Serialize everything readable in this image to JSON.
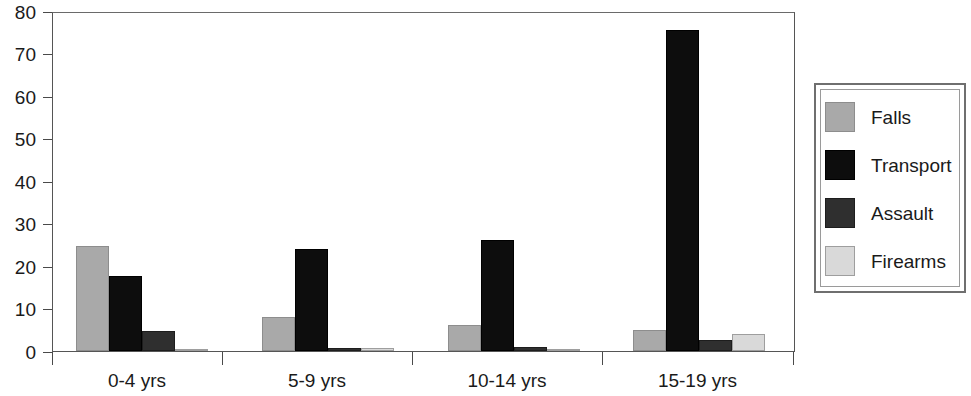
{
  "chart_data": {
    "type": "bar",
    "title": "",
    "subtitle": "",
    "xlabel": "",
    "ylabel": "",
    "categories": [
      "0-4 yrs",
      "5-9 yrs",
      "10-14 yrs",
      "15-19 yrs"
    ],
    "series": [
      {
        "name": "Falls",
        "color": "#a9a9a9",
        "values": [
          24.8,
          8.0,
          6.1,
          5.0
        ]
      },
      {
        "name": "Transport",
        "color": "#0d0d0d",
        "values": [
          17.6,
          24.0,
          26.2,
          75.5
        ]
      },
      {
        "name": "Assault",
        "color": "#2f2f2f",
        "values": [
          4.7,
          0.6,
          1.0,
          2.6
        ]
      },
      {
        "name": "Firearms",
        "color": "#d9d9d9",
        "values": [
          0.5,
          0.7,
          0.3,
          4.0
        ]
      }
    ],
    "ylim": [
      0,
      80
    ],
    "yticks": [
      0,
      10,
      20,
      30,
      40,
      50,
      60,
      70,
      80
    ],
    "ytick_labels": [
      "0",
      "10",
      "20",
      "30",
      "40",
      "50",
      "60",
      "70",
      "80"
    ],
    "grid": false,
    "legend_position": "right",
    "legend_entries": [
      "Falls",
      "Transport",
      "Assault",
      "Firearms"
    ]
  }
}
